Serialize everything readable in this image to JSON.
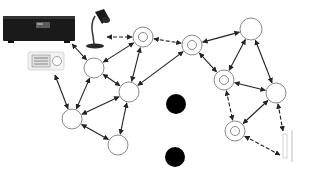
{
  "diagram": {
    "type": "network",
    "colors": {
      "stroke": "#333333",
      "node_fill": "#ffffff",
      "node_stroke": "#8a8a8a",
      "blocked": "#000000",
      "background": "#ffffff"
    },
    "devices": [
      {
        "id": "av-receiver",
        "icon": "av-receiver-icon",
        "x": 2,
        "y": 14,
        "w": 74,
        "h": 30
      },
      {
        "id": "thermostat",
        "icon": "thermostat-icon",
        "x": 28,
        "y": 50,
        "w": 36,
        "h": 20
      },
      {
        "id": "desk-lamp",
        "icon": "desk-lamp-icon",
        "x": 86,
        "y": 8,
        "w": 30,
        "h": 40
      },
      {
        "id": "wall-switch",
        "icon": "wall-switch-icon",
        "x": 282,
        "y": 132,
        "w": 12,
        "h": 28
      }
    ],
    "nodes": [
      {
        "id": "A",
        "x": 94,
        "y": 68,
        "r": 10,
        "kind": "plain"
      },
      {
        "id": "B",
        "x": 143,
        "y": 37,
        "r": 10,
        "kind": "double"
      },
      {
        "id": "C",
        "x": 192,
        "y": 45,
        "r": 10,
        "kind": "double"
      },
      {
        "id": "D",
        "x": 251,
        "y": 29,
        "r": 11,
        "kind": "plain"
      },
      {
        "id": "E",
        "x": 129,
        "y": 92,
        "r": 10,
        "kind": "plain"
      },
      {
        "id": "F",
        "x": 224,
        "y": 80,
        "r": 10,
        "kind": "double"
      },
      {
        "id": "G",
        "x": 276,
        "y": 93,
        "r": 10,
        "kind": "plain"
      },
      {
        "id": "H",
        "x": 72,
        "y": 119,
        "r": 10,
        "kind": "plain"
      },
      {
        "id": "I",
        "x": 118,
        "y": 145,
        "r": 10,
        "kind": "plain"
      },
      {
        "id": "J",
        "x": 235,
        "y": 131,
        "r": 10,
        "kind": "double"
      }
    ],
    "blocked_nodes": [
      {
        "id": "X1",
        "x": 176,
        "y": 104,
        "r": 10
      },
      {
        "id": "X2",
        "x": 175,
        "y": 157,
        "r": 10
      }
    ],
    "edges": [
      {
        "from": "lamp",
        "x1": 107,
        "y1": 37,
        "to": "B",
        "dashed": true
      },
      {
        "from": "B",
        "to": "C",
        "dashed": true
      },
      {
        "from": "receiver",
        "x1": 72,
        "y1": 44,
        "to": "A"
      },
      {
        "from": "A",
        "to": "B"
      },
      {
        "from": "A",
        "to": "E"
      },
      {
        "from": "A",
        "to": "H"
      },
      {
        "from": "B",
        "to": "E"
      },
      {
        "from": "C",
        "to": "D"
      },
      {
        "from": "C",
        "to": "E"
      },
      {
        "from": "C",
        "to": "F"
      },
      {
        "from": "D",
        "to": "F"
      },
      {
        "from": "D",
        "to": "G"
      },
      {
        "from": "F",
        "to": "G"
      },
      {
        "from": "F",
        "to": "J",
        "dashed": true
      },
      {
        "from": "G",
        "to": "J"
      },
      {
        "from": "G",
        "to": "switch",
        "x2": 283,
        "y2": 131,
        "dashed": true
      },
      {
        "from": "J",
        "to": "switch",
        "x2": 280,
        "y2": 155,
        "dashed": true
      },
      {
        "from": "thermostat",
        "x1": 55,
        "y1": 75,
        "to": "H"
      },
      {
        "from": "E",
        "to": "H"
      },
      {
        "from": "E",
        "to": "I"
      },
      {
        "from": "H",
        "to": "I"
      }
    ]
  }
}
